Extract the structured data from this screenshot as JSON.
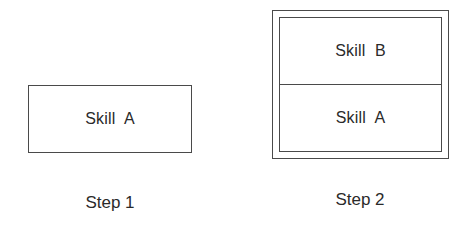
{
  "diagram": {
    "step1": {
      "caption": "Step 1",
      "boxes": [
        {
          "label": "Skill  A"
        }
      ]
    },
    "step2": {
      "caption": "Step 2",
      "boxes": [
        {
          "label": "Skill  B"
        },
        {
          "label": "Skill  A"
        }
      ]
    },
    "colors": {
      "stroke": "#4a4a4a",
      "text": "#2a2a2a",
      "background": "#ffffff"
    }
  }
}
